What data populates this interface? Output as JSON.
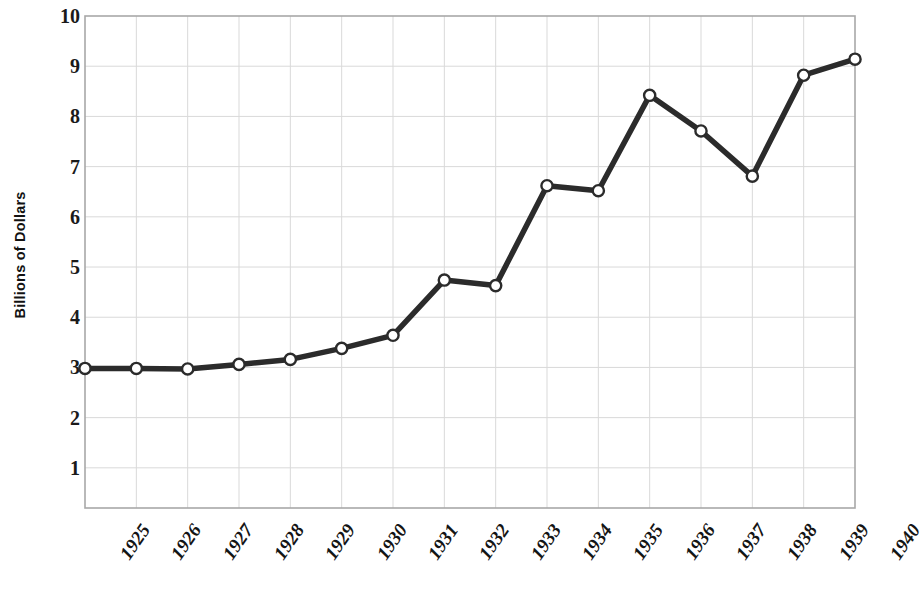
{
  "chart_data": {
    "type": "line",
    "title": "",
    "subtitle": "",
    "xlabel": "",
    "ylabel": "Billions of Dollars",
    "categories": [
      "1925",
      "1926",
      "1927",
      "1928",
      "1929",
      "1930",
      "1931",
      "1932",
      "1933",
      "1934",
      "1935",
      "1936",
      "1937",
      "1938",
      "1939",
      "1940"
    ],
    "values": [
      2.98,
      2.98,
      2.97,
      3.06,
      3.16,
      3.38,
      3.64,
      4.74,
      4.63,
      6.62,
      6.52,
      8.42,
      7.71,
      6.81,
      8.82,
      9.14
    ],
    "series": [
      {
        "name": "",
        "values": [
          2.98,
          2.98,
          2.97,
          3.06,
          3.16,
          3.38,
          3.64,
          4.74,
          4.63,
          6.62,
          6.52,
          8.42,
          7.71,
          6.81,
          8.82,
          9.14
        ]
      }
    ],
    "ylim": [
      0.2,
      10.0
    ],
    "ytick_values": [
      1,
      2,
      3,
      4,
      5,
      6,
      7,
      8,
      9,
      10
    ],
    "ytick_labels": [
      "1",
      "2",
      "3",
      "4",
      "5",
      "6",
      "7",
      "8",
      "9",
      "10"
    ],
    "grid": true,
    "grid_color": "#d9d9d9",
    "legend": "none",
    "line_color": "#2b2b2b",
    "marker_face_color": "#ffffff",
    "marker_edge_color": "#2b2b2b",
    "plot_border_color": "#a8a8a8",
    "background_color": "#ffffff"
  },
  "axes": {
    "y_title": "Billions of Dollars"
  }
}
